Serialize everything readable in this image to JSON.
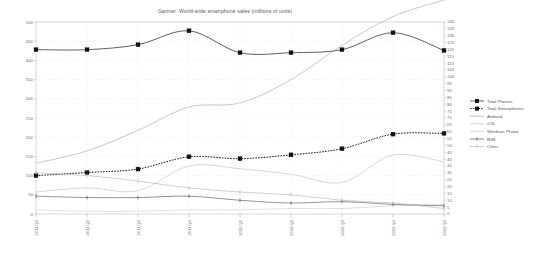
{
  "chart_data": {
    "type": "line",
    "title": "Gartner: World-wide smartphone sales (millions of units)",
    "xlabel": "",
    "ylabel": "",
    "grid": true,
    "legend_position": "right",
    "categories": [
      "2011 Q1",
      "2011 Q2",
      "2011 Q3",
      "2011 Q4",
      "2012 Q1",
      "2012 Q2",
      "2012 Q3",
      "2012 Q4",
      "2013 Q1"
    ],
    "ylim": [
      0,
      500
    ],
    "ylim_right": [
      0,
      140
    ],
    "ytick_labels": [
      "500",
      "450",
      "400",
      "350",
      "300",
      "250",
      "200",
      "150",
      "100",
      "50",
      "0"
    ],
    "ytick_values": [
      500,
      450,
      400,
      350,
      300,
      250,
      200,
      150,
      100,
      50,
      0
    ],
    "ytick_labels_right": [
      "140",
      "135",
      "130",
      "125",
      "120",
      "115",
      "110",
      "105",
      "100",
      "95",
      "90",
      "85",
      "80",
      "75",
      "70",
      "65",
      "60",
      "55",
      "50",
      "45",
      "40",
      "35",
      "30",
      "25",
      "20",
      "15",
      "10",
      "5",
      "0"
    ],
    "ytick_values_right": [
      140,
      135,
      130,
      125,
      120,
      115,
      110,
      105,
      100,
      95,
      90,
      85,
      80,
      75,
      70,
      65,
      60,
      55,
      50,
      45,
      40,
      35,
      30,
      25,
      20,
      15,
      10,
      5,
      0
    ],
    "series": [
      {
        "name": "Total Phones",
        "axis": "left",
        "color": "#4d4d4d",
        "style": "solid",
        "marker": "square",
        "values": [
          428,
          428,
          441,
          477,
          420,
          420,
          428,
          472,
          426
        ]
      },
      {
        "name": "Total Smartphones",
        "axis": "left",
        "color": "#1a1a1a",
        "style": "dotted",
        "marker": "square",
        "values": [
          100,
          108,
          117,
          149,
          144,
          154,
          170,
          208,
          210
        ]
      },
      {
        "name": "Android",
        "axis": "right",
        "color": "#9a9a9a",
        "style": "solid",
        "marker": "none",
        "values": [
          37,
          46,
          61,
          78,
          81,
          98,
          123,
          144,
          156
        ]
      },
      {
        "name": "iOS",
        "axis": "right",
        "color": "#b5b5b5",
        "style": "solid",
        "marker": "none",
        "values": [
          16,
          19,
          17,
          35,
          33,
          29,
          23,
          43,
          38
        ]
      },
      {
        "name": "Windows Phone",
        "axis": "right",
        "color": "#c2c2c2",
        "style": "solid",
        "marker": "none",
        "values": [
          3,
          2,
          2,
          3,
          3,
          4,
          4,
          6,
          7
        ]
      },
      {
        "name": "RIM",
        "axis": "right",
        "color": "#3a3a3a",
        "style": "solid",
        "marker": "tick",
        "values": [
          13,
          12,
          12,
          13,
          10,
          8,
          9,
          7,
          6
        ]
      },
      {
        "name": "Other",
        "axis": "right",
        "color": "#a8a8a8",
        "style": "solid",
        "marker": "tick",
        "values": [
          30,
          28,
          24,
          19,
          16,
          14,
          10,
          8,
          4
        ]
      }
    ]
  },
  "legend": {
    "items": [
      {
        "label": "Total Phones"
      },
      {
        "label": "Total Smartphones"
      },
      {
        "label": "Android"
      },
      {
        "label": "iOS"
      },
      {
        "label": "Windows Phone"
      },
      {
        "label": "RIM"
      },
      {
        "label": "Other"
      }
    ]
  }
}
